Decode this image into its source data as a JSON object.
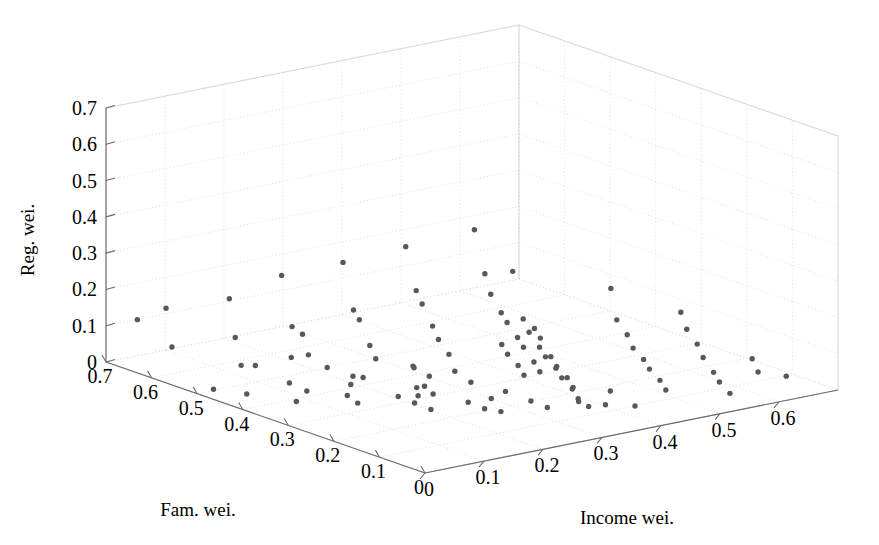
{
  "figure": {
    "type": "scatter3d",
    "background_color": "#ffffff",
    "marker_color": "#585858",
    "axis_color": "#6b6b6b",
    "grid_color": "#dcdcdc",
    "width": 879,
    "height": 545
  },
  "axes": {
    "z": {
      "name": "reg-wei-axis",
      "title": "Reg. wei.",
      "ticks": [
        "0",
        "0.1",
        "0.2",
        "0.3",
        "0.4",
        "0.5",
        "0.6",
        "0.7"
      ],
      "tick_values": [
        0,
        0.1,
        0.2,
        0.3,
        0.4,
        0.5,
        0.6,
        0.7
      ],
      "range": [
        0,
        0.7
      ]
    },
    "x": {
      "name": "fam-wei-axis",
      "title": "Fam. wei.",
      "ticks": [
        "0.7",
        "0.6",
        "0.5",
        "0.4",
        "0.3",
        "0.2",
        "0.1",
        "0"
      ],
      "tick_values": [
        0.7,
        0.6,
        0.5,
        0.4,
        0.3,
        0.2,
        0.1,
        0
      ],
      "range": [
        0,
        0.7
      ]
    },
    "y": {
      "name": "income-wei-axis",
      "title": "Income wei.",
      "ticks": [
        "0",
        "0.1",
        "0.2",
        "0.3",
        "0.4",
        "0.5",
        "0.6"
      ],
      "tick_values": [
        0,
        0.1,
        0.2,
        0.3,
        0.4,
        0.5,
        0.6
      ],
      "range": [
        0,
        0.7
      ]
    }
  },
  "chart_data": {
    "type": "scatter",
    "title": "",
    "xlabel": "Fam. wei.",
    "ylabel": "Income wei.",
    "zlabel": "Reg. wei.",
    "xlim": [
      0,
      0.7
    ],
    "ylim": [
      0,
      0.7
    ],
    "zlim": [
      0,
      0.7
    ],
    "grid": true,
    "legend": "none",
    "marker": "filled-circle",
    "marker_size_px": 5,
    "n_points": 104,
    "axis_order": "[fam_wei, income_wei, reg_wei]",
    "points": [
      [
        0.67,
        0.03,
        0.12
      ],
      [
        0.62,
        0.04,
        0.17
      ],
      [
        0.62,
        0.05,
        0.06
      ],
      [
        0.52,
        0.07,
        0.23
      ],
      [
        0.52,
        0.08,
        0.12
      ],
      [
        0.52,
        0.09,
        0.04
      ],
      [
        0.47,
        0.12,
        0.3
      ],
      [
        0.46,
        0.13,
        0.16
      ],
      [
        0.45,
        0.14,
        0.14
      ],
      [
        0.45,
        0.15,
        0.08
      ],
      [
        0.44,
        0.11,
        0.02
      ],
      [
        0.4,
        0.17,
        0.35
      ],
      [
        0.39,
        0.18,
        0.22
      ],
      [
        0.39,
        0.19,
        0.19
      ],
      [
        0.38,
        0.2,
        0.12
      ],
      [
        0.38,
        0.21,
        0.08
      ],
      [
        0.37,
        0.16,
        0.03
      ],
      [
        0.34,
        0.23,
        0.4
      ],
      [
        0.33,
        0.24,
        0.28
      ],
      [
        0.33,
        0.25,
        0.24
      ],
      [
        0.32,
        0.26,
        0.18
      ],
      [
        0.32,
        0.27,
        0.14
      ],
      [
        0.31,
        0.28,
        0.1
      ],
      [
        0.31,
        0.29,
        0.05
      ],
      [
        0.3,
        0.22,
        0.01
      ],
      [
        0.28,
        0.3,
        0.45
      ],
      [
        0.27,
        0.31,
        0.33
      ],
      [
        0.27,
        0.32,
        0.27
      ],
      [
        0.26,
        0.33,
        0.22
      ],
      [
        0.26,
        0.34,
        0.19
      ],
      [
        0.25,
        0.35,
        0.15
      ],
      [
        0.25,
        0.36,
        0.12
      ],
      [
        0.24,
        0.37,
        0.08
      ],
      [
        0.24,
        0.38,
        0.05
      ],
      [
        0.23,
        0.29,
        0.01
      ],
      [
        0.22,
        0.3,
        0.16
      ],
      [
        0.22,
        0.31,
        0.13
      ],
      [
        0.21,
        0.32,
        0.1
      ],
      [
        0.21,
        0.33,
        0.07
      ],
      [
        0.2,
        0.34,
        0.2
      ],
      [
        0.2,
        0.35,
        0.17
      ],
      [
        0.19,
        0.36,
        0.12
      ],
      [
        0.19,
        0.37,
        0.09
      ],
      [
        0.18,
        0.38,
        0.06
      ],
      [
        0.18,
        0.39,
        0.03
      ],
      [
        0.17,
        0.28,
        0.39
      ],
      [
        0.16,
        0.29,
        0.26
      ],
      [
        0.16,
        0.3,
        0.22
      ],
      [
        0.15,
        0.31,
        0.18
      ],
      [
        0.15,
        0.32,
        0.15
      ],
      [
        0.14,
        0.33,
        0.12
      ],
      [
        0.14,
        0.34,
        0.09
      ],
      [
        0.13,
        0.35,
        0.06
      ],
      [
        0.13,
        0.36,
        0.03
      ],
      [
        0.12,
        0.37,
        0.01
      ],
      [
        0.11,
        0.4,
        0.33
      ],
      [
        0.11,
        0.41,
        0.24
      ],
      [
        0.1,
        0.42,
        0.2
      ],
      [
        0.1,
        0.43,
        0.16
      ],
      [
        0.09,
        0.44,
        0.13
      ],
      [
        0.09,
        0.45,
        0.1
      ],
      [
        0.08,
        0.46,
        0.07
      ],
      [
        0.08,
        0.47,
        0.04
      ],
      [
        0.07,
        0.41,
        0.02
      ],
      [
        0.06,
        0.48,
        0.26
      ],
      [
        0.06,
        0.49,
        0.21
      ],
      [
        0.05,
        0.5,
        0.17
      ],
      [
        0.05,
        0.51,
        0.13
      ],
      [
        0.04,
        0.52,
        0.09
      ],
      [
        0.04,
        0.53,
        0.06
      ],
      [
        0.03,
        0.54,
        0.03
      ],
      [
        0.02,
        0.57,
        0.12
      ],
      [
        0.02,
        0.58,
        0.08
      ],
      [
        0.01,
        0.62,
        0.06
      ],
      [
        0.49,
        0.02,
        0.01
      ],
      [
        0.43,
        0.03,
        0.02
      ],
      [
        0.36,
        0.06,
        0.02
      ],
      [
        0.35,
        0.07,
        0.05
      ],
      [
        0.3,
        0.1,
        0.05
      ],
      [
        0.29,
        0.11,
        0.03
      ],
      [
        0.24,
        0.14,
        0.06
      ],
      [
        0.23,
        0.16,
        0.04
      ],
      [
        0.22,
        0.18,
        0.02
      ],
      [
        0.35,
        0.25,
        0.06
      ],
      [
        0.34,
        0.27,
        0.03
      ],
      [
        0.29,
        0.21,
        0.04
      ],
      [
        0.28,
        0.23,
        0.02
      ],
      [
        0.19,
        0.22,
        0.04
      ],
      [
        0.18,
        0.24,
        0.02
      ],
      [
        0.17,
        0.26,
        0.01
      ],
      [
        0.13,
        0.28,
        0.05
      ],
      [
        0.12,
        0.3,
        0.03
      ],
      [
        0.45,
        0.06,
        0.08
      ],
      [
        0.41,
        0.09,
        0.11
      ],
      [
        0.37,
        0.12,
        0.09
      ],
      [
        0.33,
        0.15,
        0.07
      ],
      [
        0.27,
        0.19,
        0.11
      ],
      [
        0.26,
        0.2,
        0.06
      ],
      [
        0.21,
        0.24,
        0.08
      ],
      [
        0.16,
        0.26,
        0.07
      ],
      [
        0.09,
        0.33,
        0.05
      ],
      [
        0.07,
        0.36,
        0.04
      ],
      [
        0.43,
        0.21,
        0.01
      ],
      [
        0.15,
        0.43,
        0.02
      ]
    ]
  }
}
